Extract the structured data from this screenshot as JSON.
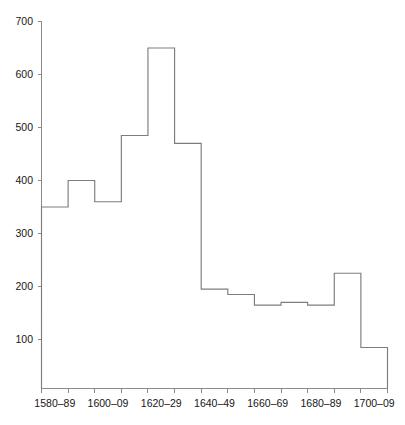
{
  "chart_data": {
    "type": "bar",
    "title": "",
    "subtitle": "",
    "xlabel": "",
    "ylabel": "",
    "categories": [
      "1580–89",
      "1590–99",
      "1600–09",
      "1610–19",
      "1620–29",
      "1630–39",
      "1640–49",
      "1650–59",
      "1660–69",
      "1670–79",
      "1680–89",
      "1690–99",
      "1700–09"
    ],
    "values": [
      350,
      400,
      360,
      485,
      650,
      470,
      195,
      185,
      165,
      170,
      165,
      225,
      85
    ],
    "bin_edges": [
      1580,
      1590,
      1600,
      1610,
      1620,
      1630,
      1640,
      1650,
      1660,
      1670,
      1680,
      1690,
      1700,
      1710
    ],
    "xlim": [
      1580,
      1710
    ],
    "ylim": [
      0,
      700
    ],
    "y_ticks": [
      100,
      200,
      300,
      400,
      500,
      600,
      700
    ],
    "y_tick_labels": [
      "100",
      "200",
      "300",
      "400",
      "500",
      "600",
      "700"
    ],
    "x_tick_labels": [
      "1580–89",
      "1600–09",
      "1620–29",
      "1640–49",
      "1660–69",
      "1680–89",
      "1700–09"
    ],
    "x_tick_label_positions": [
      1585,
      1605,
      1625,
      1645,
      1665,
      1685,
      1705
    ],
    "grid": false,
    "legend": false,
    "legend_position": "none",
    "style": "step-outline histogram, no fill",
    "colors": {
      "line": "#7d7d7d",
      "axis": "#8a8a8a",
      "text": "#161616",
      "background": "#ffffff"
    }
  }
}
